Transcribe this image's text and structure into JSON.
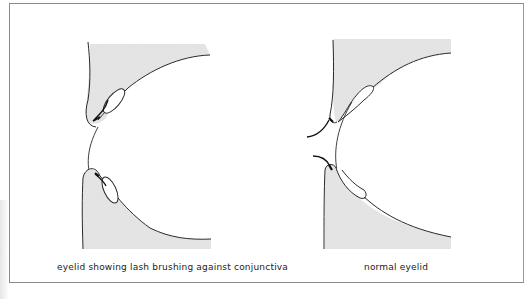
{
  "figure": {
    "panels": [
      {
        "id": "left",
        "caption": "eyelid showing lash brushing against conjunctiva"
      },
      {
        "id": "right",
        "caption": "normal eyelid"
      }
    ],
    "colors": {
      "lid_fill": "#e3e3e3",
      "outline": "#2a2a2a",
      "frame": "#8a8a8a",
      "background": "#ffffff"
    }
  }
}
